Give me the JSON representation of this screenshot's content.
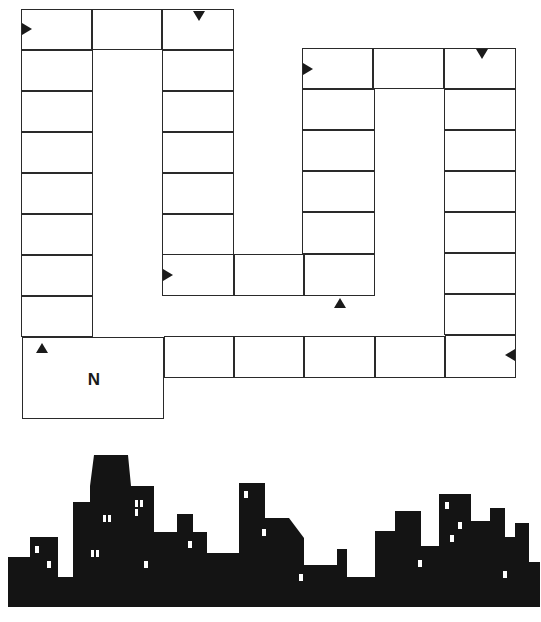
{
  "colors": {
    "line": "#2a2a2a",
    "fill": "#ffffff",
    "silhouette": "#141414",
    "window": "#ffffff"
  },
  "start_space": {
    "label": "N",
    "x": 22,
    "y": 337,
    "w": 142,
    "h": 82
  },
  "cells": [
    {
      "x": 21,
      "y": 9,
      "w": 71,
      "h": 41
    },
    {
      "x": 92,
      "y": 9,
      "w": 70,
      "h": 41
    },
    {
      "x": 162,
      "y": 9,
      "w": 72,
      "h": 41
    },
    {
      "x": 21,
      "y": 50,
      "w": 72,
      "h": 41
    },
    {
      "x": 21,
      "y": 91,
      "w": 72,
      "h": 41
    },
    {
      "x": 21,
      "y": 132,
      "w": 72,
      "h": 41
    },
    {
      "x": 21,
      "y": 173,
      "w": 72,
      "h": 41
    },
    {
      "x": 21,
      "y": 214,
      "w": 72,
      "h": 41
    },
    {
      "x": 21,
      "y": 255,
      "w": 72,
      "h": 41
    },
    {
      "x": 21,
      "y": 296,
      "w": 72,
      "h": 41
    },
    {
      "x": 162,
      "y": 50,
      "w": 72,
      "h": 41
    },
    {
      "x": 162,
      "y": 91,
      "w": 72,
      "h": 41
    },
    {
      "x": 162,
      "y": 132,
      "w": 72,
      "h": 41
    },
    {
      "x": 162,
      "y": 173,
      "w": 72,
      "h": 41
    },
    {
      "x": 162,
      "y": 214,
      "w": 72,
      "h": 41
    },
    {
      "x": 162,
      "y": 254,
      "w": 72,
      "h": 42
    },
    {
      "x": 234,
      "y": 254,
      "w": 70,
      "h": 42
    },
    {
      "x": 304,
      "y": 254,
      "w": 71,
      "h": 42
    },
    {
      "x": 302,
      "y": 48,
      "w": 71,
      "h": 41
    },
    {
      "x": 373,
      "y": 48,
      "w": 71,
      "h": 41
    },
    {
      "x": 444,
      "y": 48,
      "w": 72,
      "h": 41
    },
    {
      "x": 302,
      "y": 89,
      "w": 73,
      "h": 41
    },
    {
      "x": 302,
      "y": 130,
      "w": 73,
      "h": 41
    },
    {
      "x": 302,
      "y": 171,
      "w": 73,
      "h": 41
    },
    {
      "x": 302,
      "y": 212,
      "w": 73,
      "h": 42
    },
    {
      "x": 444,
      "y": 89,
      "w": 72,
      "h": 41
    },
    {
      "x": 444,
      "y": 130,
      "w": 72,
      "h": 41
    },
    {
      "x": 444,
      "y": 171,
      "w": 72,
      "h": 41
    },
    {
      "x": 444,
      "y": 212,
      "w": 72,
      "h": 41
    },
    {
      "x": 444,
      "y": 253,
      "w": 72,
      "h": 41
    },
    {
      "x": 444,
      "y": 294,
      "w": 72,
      "h": 41
    },
    {
      "x": 164,
      "y": 336,
      "w": 70,
      "h": 42
    },
    {
      "x": 234,
      "y": 336,
      "w": 70,
      "h": 42
    },
    {
      "x": 304,
      "y": 336,
      "w": 71,
      "h": 42
    },
    {
      "x": 375,
      "y": 336,
      "w": 70,
      "h": 42
    },
    {
      "x": 445,
      "y": 335,
      "w": 71,
      "h": 43
    }
  ],
  "arrows": [
    {
      "dir": "right",
      "x": 22,
      "y": 23
    },
    {
      "dir": "down",
      "x": 193,
      "y": 11
    },
    {
      "dir": "right",
      "x": 303,
      "y": 63
    },
    {
      "dir": "down",
      "x": 476,
      "y": 49
    },
    {
      "dir": "right",
      "x": 163,
      "y": 269
    },
    {
      "dir": "up",
      "x": 334,
      "y": 298
    },
    {
      "dir": "left",
      "x": 505,
      "y": 349
    },
    {
      "dir": "up",
      "x": 36,
      "y": 343
    }
  ],
  "skyline": {
    "outline": "8,168 8,117 30,117 30,97 58,97 58,137 73,137 73,62 90,62 90,46 94,15 128,15 131,46 154,46 154,92 177,92 177,74 193,74 193,92 207,92 207,113 239,113 239,43 265,43 265,78 289,78 304,98 304,125 314,125 337,125 337,109 347,109 347,137 375,137 375,91 395,91 395,71 421,71 421,106 439,106 439,54 471,54 471,81 490,81 490,68 505,68 505,97 515,97 515,83 529,83 529,122 540,122 540,167 8,167",
    "windows": [
      {
        "x": 35,
        "y": 106,
        "w": 4,
        "h": 7
      },
      {
        "x": 47,
        "y": 121,
        "w": 4,
        "h": 7
      },
      {
        "x": 91,
        "y": 110,
        "w": 3,
        "h": 7
      },
      {
        "x": 96,
        "y": 110,
        "w": 3,
        "h": 7
      },
      {
        "x": 103,
        "y": 75,
        "w": 3,
        "h": 7
      },
      {
        "x": 108,
        "y": 75,
        "w": 3,
        "h": 7
      },
      {
        "x": 135,
        "y": 60,
        "w": 3,
        "h": 7
      },
      {
        "x": 140,
        "y": 60,
        "w": 3,
        "h": 7
      },
      {
        "x": 135,
        "y": 69,
        "w": 3,
        "h": 7
      },
      {
        "x": 144,
        "y": 121,
        "w": 4,
        "h": 7
      },
      {
        "x": 188,
        "y": 101,
        "w": 4,
        "h": 7
      },
      {
        "x": 244,
        "y": 51,
        "w": 4,
        "h": 7
      },
      {
        "x": 262,
        "y": 89,
        "w": 4,
        "h": 7
      },
      {
        "x": 299,
        "y": 134,
        "w": 4,
        "h": 7
      },
      {
        "x": 418,
        "y": 120,
        "w": 4,
        "h": 7
      },
      {
        "x": 445,
        "y": 62,
        "w": 4,
        "h": 7
      },
      {
        "x": 458,
        "y": 82,
        "w": 4,
        "h": 7
      },
      {
        "x": 450,
        "y": 95,
        "w": 4,
        "h": 7
      },
      {
        "x": 503,
        "y": 131,
        "w": 4,
        "h": 7
      }
    ]
  }
}
